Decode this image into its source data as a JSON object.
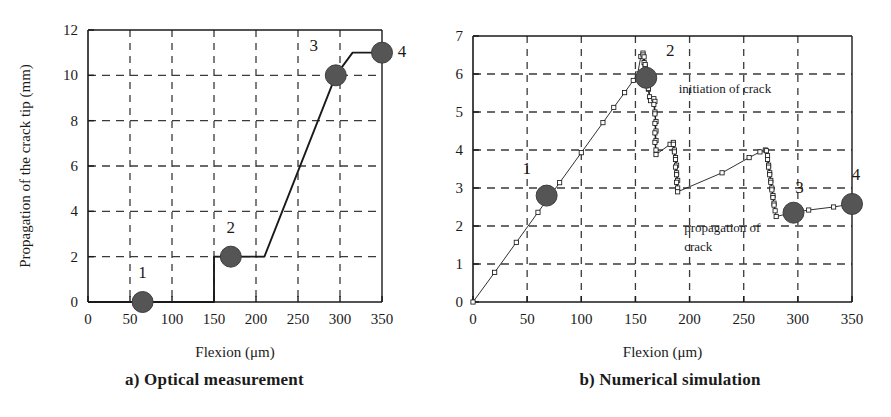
{
  "figure": {
    "panels": [
      {
        "id": "a",
        "caption": "a) Optical measurement"
      },
      {
        "id": "b",
        "caption": "b) Numerical simulation"
      }
    ]
  },
  "chart_data": [
    {
      "type": "line",
      "panel": "a",
      "title": "a) Optical measurement",
      "xlabel": "Flexion (μm)",
      "ylabel": "Propagation of the crack tip (mm)",
      "xlim": [
        0,
        350
      ],
      "ylim": [
        0,
        12
      ],
      "xticks": [
        0,
        50,
        100,
        150,
        200,
        250,
        300,
        350
      ],
      "yticks": [
        0,
        2,
        4,
        6,
        8,
        10,
        12
      ],
      "xtick_labels": [
        "0",
        "50",
        "100",
        "150",
        "200",
        "250",
        "300",
        "350"
      ],
      "ytick_labels": [
        "0",
        "2",
        "4",
        "6",
        "8",
        "10",
        "12"
      ],
      "grid": true,
      "grid_style": "dashed",
      "legend": false,
      "series": [
        {
          "name": "crack tip propagation",
          "points": [
            [
              0,
              0
            ],
            [
              150,
              0
            ],
            [
              150,
              2
            ],
            [
              210,
              2
            ],
            [
              295,
              10
            ],
            [
              315,
              11
            ],
            [
              350,
              11
            ]
          ]
        }
      ],
      "markers": [
        {
          "label": "1",
          "x": 65,
          "y": 0,
          "label_dx": 0,
          "label_dy": -24
        },
        {
          "label": "2",
          "x": 170,
          "y": 2,
          "label_dx": 0,
          "label_dy": -24
        },
        {
          "label": "3",
          "x": 295,
          "y": 10,
          "label_dx": -22,
          "label_dy": -24
        },
        {
          "label": "4",
          "x": 350,
          "y": 11,
          "label_dx": 20,
          "label_dy": 4
        }
      ]
    },
    {
      "type": "line",
      "panel": "b",
      "title": "b) Numerical simulation",
      "xlabel": "Flexion (μm)",
      "ylabel": "σ (MPa)",
      "xlim": [
        0,
        350
      ],
      "ylim": [
        0,
        7
      ],
      "xticks": [
        0,
        50,
        100,
        150,
        200,
        250,
        300,
        350
      ],
      "yticks": [
        0,
        1,
        2,
        3,
        4,
        5,
        6,
        7
      ],
      "xtick_labels": [
        "0",
        "50",
        "100",
        "150",
        "200",
        "250",
        "300",
        "350"
      ],
      "ytick_labels": [
        "0",
        "1",
        "2",
        "3",
        "4",
        "5",
        "6",
        "7"
      ],
      "grid": true,
      "grid_style": "dashed",
      "legend": false,
      "series": [
        {
          "name": "stress vs flexion",
          "marker": "open-square",
          "points": [
            [
              0,
              0
            ],
            [
              20,
              0.78
            ],
            [
              40,
              1.57
            ],
            [
              60,
              2.36
            ],
            [
              80,
              3.14
            ],
            [
              100,
              3.93
            ],
            [
              120,
              4.72
            ],
            [
              130,
              5.12
            ],
            [
              140,
              5.51
            ],
            [
              148,
              5.83
            ],
            [
              152,
              6.0
            ],
            [
              155,
              6.46
            ],
            [
              157,
              6.55
            ],
            [
              158,
              6.3
            ],
            [
              157,
              6.5
            ],
            [
              159,
              6.2
            ],
            [
              158,
              6.45
            ],
            [
              160,
              6.0
            ],
            [
              159,
              6.25
            ],
            [
              161,
              5.8
            ],
            [
              160,
              6.05
            ],
            [
              162,
              5.6
            ],
            [
              161,
              5.85
            ],
            [
              163,
              5.4
            ],
            [
              162,
              5.62
            ],
            [
              164,
              5.3
            ],
            [
              167,
              5.35
            ],
            [
              168,
              5.28
            ],
            [
              168,
              5.0
            ],
            [
              167,
              5.2
            ],
            [
              169,
              4.75
            ],
            [
              168,
              4.95
            ],
            [
              169,
              4.5
            ],
            [
              168,
              4.7
            ],
            [
              169,
              4.25
            ],
            [
              168,
              4.45
            ],
            [
              169,
              4.0
            ],
            [
              168,
              4.2
            ],
            [
              169,
              3.88
            ],
            [
              182,
              4.15
            ],
            [
              185,
              4.2
            ],
            [
              186,
              4.0
            ],
            [
              185,
              4.15
            ],
            [
              187,
              3.8
            ],
            [
              186,
              3.95
            ],
            [
              188,
              3.6
            ],
            [
              187,
              3.75
            ],
            [
              188,
              3.4
            ],
            [
              187,
              3.55
            ],
            [
              189,
              3.2
            ],
            [
              188,
              3.35
            ],
            [
              189,
              3.0
            ],
            [
              188,
              3.15
            ],
            [
              189,
              2.9
            ],
            [
              230,
              3.4
            ],
            [
              255,
              3.8
            ],
            [
              265,
              3.95
            ],
            [
              270,
              4.0
            ],
            [
              272,
              3.85
            ],
            [
              271,
              3.98
            ],
            [
              273,
              3.6
            ],
            [
              272,
              3.75
            ],
            [
              274,
              3.4
            ],
            [
              273,
              3.55
            ],
            [
              275,
              3.2
            ],
            [
              274,
              3.35
            ],
            [
              276,
              3.0
            ],
            [
              275,
              3.15
            ],
            [
              277,
              2.8
            ],
            [
              276,
              2.95
            ],
            [
              278,
              2.6
            ],
            [
              277,
              2.75
            ],
            [
              279,
              2.4
            ],
            [
              278,
              2.55
            ],
            [
              280,
              2.25
            ],
            [
              295,
              2.35
            ],
            [
              310,
              2.42
            ],
            [
              333,
              2.5
            ],
            [
              350,
              2.58
            ]
          ]
        }
      ],
      "markers": [
        {
          "label": "1",
          "x": 68,
          "y": 2.8,
          "label_dx": -20,
          "label_dy": -22
        },
        {
          "label": "2",
          "x": 160,
          "y": 5.9,
          "label_dx": 24,
          "label_dy": -22
        },
        {
          "label": "3",
          "x": 296,
          "y": 2.35,
          "label_dx": 6,
          "label_dy": -20
        },
        {
          "label": "4",
          "x": 350,
          "y": 2.58,
          "label_dx": 4,
          "label_dy": -24
        }
      ],
      "annotations": [
        {
          "text": "initiation of crack",
          "x": 190,
          "y": 5.5
        },
        {
          "text": "propagation of",
          "x": 195,
          "y": 1.85
        },
        {
          "text": "crack",
          "x": 195,
          "y": 1.35
        }
      ]
    }
  ],
  "style": {
    "line_color": "#1a1a1a",
    "marker_fill": "#555555",
    "grid_color": "#3a3a3a",
    "axis_color": "#1a1a1a",
    "text_color": "#1a1a1a",
    "background": "#ffffff"
  }
}
